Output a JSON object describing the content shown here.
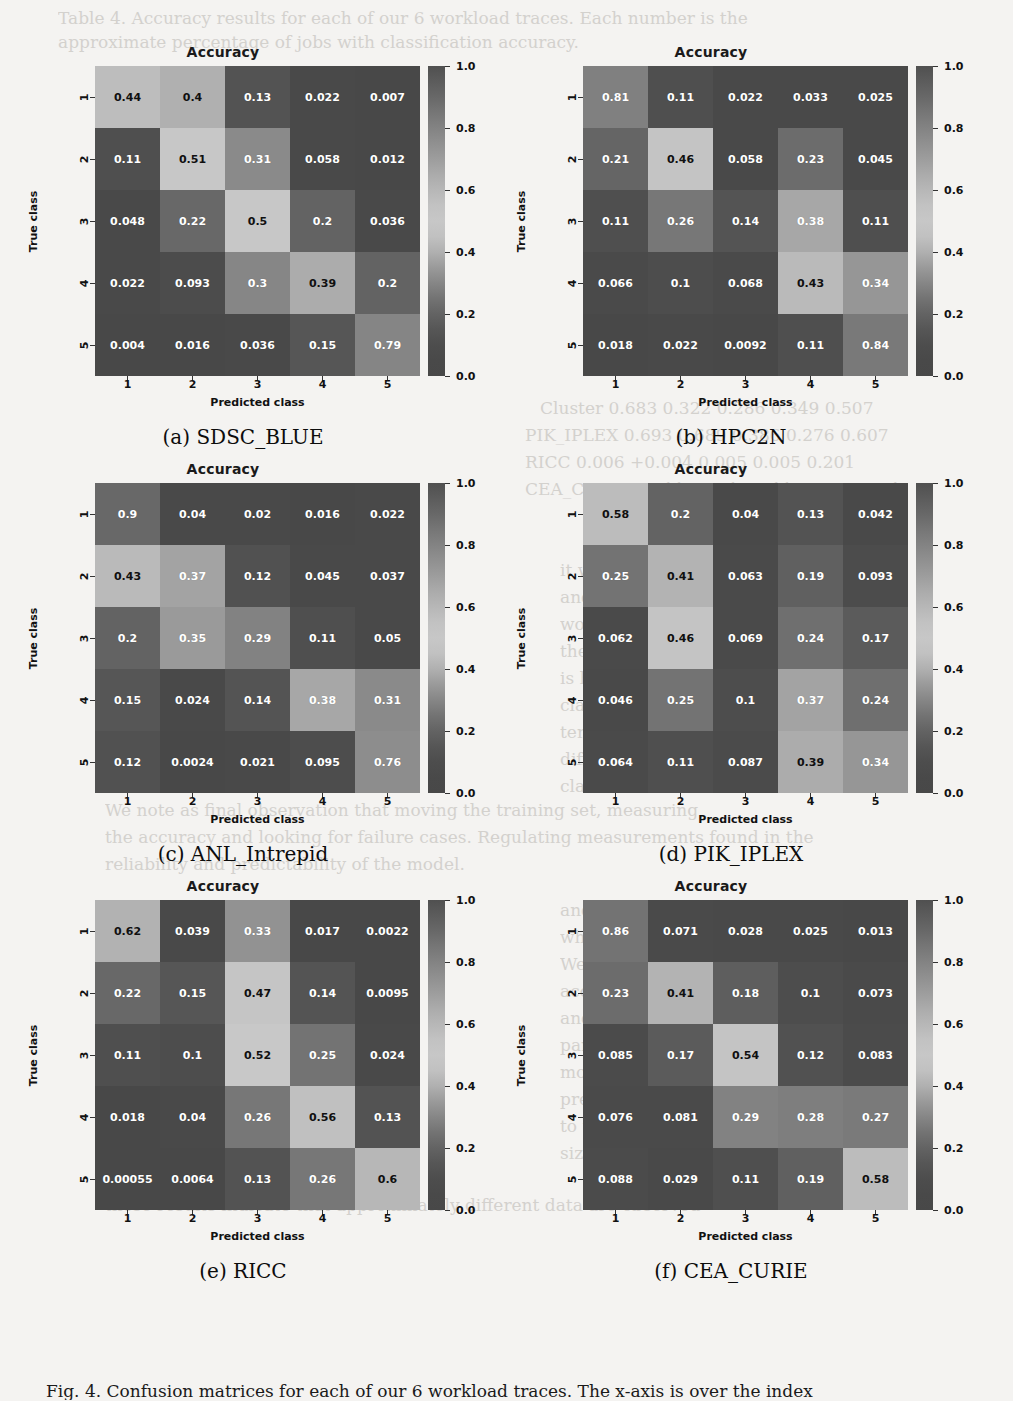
{
  "figure": {
    "caption": "Fig. 4. Confusion matrices for each of our 6 workload traces. The x-axis is over the index",
    "ghost_texts": [
      {
        "text": "Table 4. Accuracy results for each of our 6 workload traces. Each number is the",
        "x": 58,
        "y": 8,
        "size": 17
      },
      {
        "text": "approximate percentage of jobs with classification accuracy.",
        "x": 58,
        "y": 32,
        "size": 17
      },
      {
        "text": "0.226",
        "x": 672,
        "y": 175,
        "size": 17
      },
      {
        "text": "0.342",
        "x": 700,
        "y": 263,
        "size": 17
      },
      {
        "text": "0.588",
        "x": 700,
        "y": 322,
        "size": 17
      },
      {
        "text": "Cluster     0.683    0.322    0.286    0.349    0.507",
        "x": 540,
        "y": 398,
        "size": 17
      },
      {
        "text": "PIK_IPLEX   0.693    0.689    0.386    0.276    0.607",
        "x": 525,
        "y": 425,
        "size": 17
      },
      {
        "text": "RICC        0.006   +0.004    0.005    0.005    0.201",
        "x": 525,
        "y": 452,
        "size": 17
      },
      {
        "text": "CEA_CURIE   0.911    0.901    0.911    0.907    0.921",
        "x": 525,
        "y": 479,
        "size": 17
      },
      {
        "text": "0.903    0.907    0.903",
        "x": 600,
        "y": 506,
        "size": 17
      },
      {
        "text": "it was measured over a",
        "x": 560,
        "y": 560,
        "size": 17
      },
      {
        "text": "and the quality of the",
        "x": 560,
        "y": 587,
        "size": 17
      },
      {
        "text": "work. It is notable that",
        "x": 560,
        "y": 614,
        "size": 17
      },
      {
        "text": "the accuracy of the model",
        "x": 560,
        "y": 641,
        "size": 17
      },
      {
        "text": "is higher for the easier",
        "x": 560,
        "y": 668,
        "size": 17
      },
      {
        "text": "classes, and the model",
        "x": 560,
        "y": 695,
        "size": 17
      },
      {
        "text": "tends to under-predict the",
        "x": 560,
        "y": 722,
        "size": 17
      },
      {
        "text": "difficult intermediate",
        "x": 560,
        "y": 749,
        "size": 17
      },
      {
        "text": "classes in most traces.",
        "x": 560,
        "y": 776,
        "size": 17
      },
      {
        "text": "We note as final observation that moving the training set, measuring",
        "x": 105,
        "y": 800,
        "size": 17
      },
      {
        "text": "the accuracy and looking for failure cases. Regulating measurements found in the",
        "x": 105,
        "y": 827,
        "size": 17
      },
      {
        "text": "reliability and predictability of the model.",
        "x": 105,
        "y": 854,
        "size": 17
      },
      {
        "text": "and the number of jobs",
        "x": 560,
        "y": 900,
        "size": 17
      },
      {
        "text": "which is close to the",
        "x": 560,
        "y": 927,
        "size": 17
      },
      {
        "text": "We can observe that all",
        "x": 560,
        "y": 954,
        "size": 17
      },
      {
        "text": "accuracy of the models",
        "x": 560,
        "y": 981,
        "size": 17
      },
      {
        "text": "and the HPC2N trace in",
        "x": 560,
        "y": 1008,
        "size": 17
      },
      {
        "text": "particular seems to be a",
        "x": 560,
        "y": 1035,
        "size": 17
      },
      {
        "text": "more difficult dataset to",
        "x": 560,
        "y": 1062,
        "size": 17
      },
      {
        "text": "predict, which may be due",
        "x": 560,
        "y": 1089,
        "size": 17
      },
      {
        "text": "to the relatively smaller",
        "x": 560,
        "y": 1116,
        "size": 17
      },
      {
        "text": "size of its training set.",
        "x": 560,
        "y": 1143,
        "size": 17
      },
      {
        "text": "these results indicate that approximately different data are observed",
        "x": 105,
        "y": 1195,
        "size": 17
      }
    ]
  },
  "colorbar": {
    "ticks": [
      "1.0",
      "0.8",
      "0.6",
      "0.4",
      "0.2",
      "0.0"
    ],
    "tick_values": [
      1.0,
      0.8,
      0.6,
      0.4,
      0.2,
      0.0
    ],
    "vmin": 0.0,
    "vmax": 1.0
  },
  "axis": {
    "title": "Accuracy",
    "xlabel": "Predicted class",
    "ylabel": "True class",
    "xticks": [
      "1",
      "2",
      "3",
      "4",
      "5"
    ],
    "yticks": [
      "1",
      "2",
      "3",
      "4",
      "5"
    ]
  },
  "chart_data": [
    {
      "type": "heatmap",
      "panel": "a",
      "caption": "(a) SDSC_BLUE",
      "title": "Accuracy",
      "xlabel": "Predicted class",
      "ylabel": "True class",
      "xticklabels": [
        "1",
        "2",
        "3",
        "4",
        "5"
      ],
      "yticklabels": [
        "1",
        "2",
        "3",
        "4",
        "5"
      ],
      "zlim": [
        0.0,
        1.0
      ],
      "matrix": [
        [
          0.44,
          0.4,
          0.13,
          0.022,
          0.007
        ],
        [
          0.11,
          0.51,
          0.31,
          0.058,
          0.012
        ],
        [
          0.048,
          0.22,
          0.5,
          0.2,
          0.036
        ],
        [
          0.022,
          0.093,
          0.3,
          0.39,
          0.2
        ],
        [
          0.004,
          0.016,
          0.036,
          0.15,
          0.79
        ]
      ],
      "labels": [
        [
          "0.44",
          "0.4",
          "0.13",
          "0.022",
          "0.007"
        ],
        [
          "0.11",
          "0.51",
          "0.31",
          "0.058",
          "0.012"
        ],
        [
          "0.048",
          "0.22",
          "0.5",
          "0.2",
          "0.036"
        ],
        [
          "0.022",
          "0.093",
          "0.3",
          "0.39",
          "0.2"
        ],
        [
          "0.004",
          "0.016",
          "0.036",
          "0.15",
          "0.79"
        ]
      ]
    },
    {
      "type": "heatmap",
      "panel": "b",
      "caption": "(b) HPC2N",
      "title": "Accuracy",
      "xlabel": "Predicted class",
      "ylabel": "True class",
      "xticklabels": [
        "1",
        "2",
        "3",
        "4",
        "5"
      ],
      "yticklabels": [
        "1",
        "2",
        "3",
        "4",
        "5"
      ],
      "zlim": [
        0.0,
        1.0
      ],
      "matrix": [
        [
          0.81,
          0.11,
          0.022,
          0.033,
          0.025
        ],
        [
          0.21,
          0.46,
          0.058,
          0.23,
          0.045
        ],
        [
          0.11,
          0.26,
          0.14,
          0.38,
          0.11
        ],
        [
          0.066,
          0.1,
          0.068,
          0.43,
          0.34
        ],
        [
          0.018,
          0.022,
          0.0092,
          0.11,
          0.84
        ]
      ],
      "labels": [
        [
          "0.81",
          "0.11",
          "0.022",
          "0.033",
          "0.025"
        ],
        [
          "0.21",
          "0.46",
          "0.058",
          "0.23",
          "0.045"
        ],
        [
          "0.11",
          "0.26",
          "0.14",
          "0.38",
          "0.11"
        ],
        [
          "0.066",
          "0.1",
          "0.068",
          "0.43",
          "0.34"
        ],
        [
          "0.018",
          "0.022",
          "0.0092",
          "0.11",
          "0.84"
        ]
      ]
    },
    {
      "type": "heatmap",
      "panel": "c",
      "caption": "(c) ANL_Intrepid",
      "title": "Accuracy",
      "xlabel": "Predicted class",
      "ylabel": "True class",
      "xticklabels": [
        "1",
        "2",
        "3",
        "4",
        "5"
      ],
      "yticklabels": [
        "1",
        "2",
        "3",
        "4",
        "5"
      ],
      "zlim": [
        0.0,
        1.0
      ],
      "matrix": [
        [
          0.9,
          0.04,
          0.02,
          0.016,
          0.022
        ],
        [
          0.43,
          0.37,
          0.12,
          0.045,
          0.037
        ],
        [
          0.2,
          0.35,
          0.29,
          0.11,
          0.05
        ],
        [
          0.15,
          0.024,
          0.14,
          0.38,
          0.31
        ],
        [
          0.12,
          0.0024,
          0.021,
          0.095,
          0.76
        ]
      ],
      "labels": [
        [
          "0.9",
          "0.04",
          "0.02",
          "0.016",
          "0.022"
        ],
        [
          "0.43",
          "0.37",
          "0.12",
          "0.045",
          "0.037"
        ],
        [
          "0.2",
          "0.35",
          "0.29",
          "0.11",
          "0.05"
        ],
        [
          "0.15",
          "0.024",
          "0.14",
          "0.38",
          "0.31"
        ],
        [
          "0.12",
          "0.0024",
          "0.021",
          "0.095",
          "0.76"
        ]
      ]
    },
    {
      "type": "heatmap",
      "panel": "d",
      "caption": "(d) PIK_IPLEX",
      "title": "Accuracy",
      "xlabel": "Predicted class",
      "ylabel": "True class",
      "xticklabels": [
        "1",
        "2",
        "3",
        "4",
        "5"
      ],
      "yticklabels": [
        "1",
        "2",
        "3",
        "4",
        "5"
      ],
      "zlim": [
        0.0,
        1.0
      ],
      "matrix": [
        [
          0.58,
          0.2,
          0.04,
          0.13,
          0.042
        ],
        [
          0.25,
          0.41,
          0.063,
          0.19,
          0.093
        ],
        [
          0.062,
          0.46,
          0.069,
          0.24,
          0.17
        ],
        [
          0.046,
          0.25,
          0.1,
          0.37,
          0.24
        ],
        [
          0.064,
          0.11,
          0.087,
          0.39,
          0.34
        ]
      ],
      "labels": [
        [
          "0.58",
          "0.2",
          "0.04",
          "0.13",
          "0.042"
        ],
        [
          "0.25",
          "0.41",
          "0.063",
          "0.19",
          "0.093"
        ],
        [
          "0.062",
          "0.46",
          "0.069",
          "0.24",
          "0.17"
        ],
        [
          "0.046",
          "0.25",
          "0.1",
          "0.37",
          "0.24"
        ],
        [
          "0.064",
          "0.11",
          "0.087",
          "0.39",
          "0.34"
        ]
      ]
    },
    {
      "type": "heatmap",
      "panel": "e",
      "caption": "(e) RICC",
      "title": "Accuracy",
      "xlabel": "Predicted class",
      "ylabel": "True class",
      "xticklabels": [
        "1",
        "2",
        "3",
        "4",
        "5"
      ],
      "yticklabels": [
        "1",
        "2",
        "3",
        "4",
        "5"
      ],
      "zlim": [
        0.0,
        1.0
      ],
      "matrix": [
        [
          0.62,
          0.039,
          0.33,
          0.017,
          0.0022
        ],
        [
          0.22,
          0.15,
          0.47,
          0.14,
          0.0095
        ],
        [
          0.11,
          0.1,
          0.52,
          0.25,
          0.024
        ],
        [
          0.018,
          0.04,
          0.26,
          0.56,
          0.13
        ],
        [
          0.00055,
          0.0064,
          0.13,
          0.26,
          0.6
        ]
      ],
      "labels": [
        [
          "0.62",
          "0.039",
          "0.33",
          "0.017",
          "0.0022"
        ],
        [
          "0.22",
          "0.15",
          "0.47",
          "0.14",
          "0.0095"
        ],
        [
          "0.11",
          "0.1",
          "0.52",
          "0.25",
          "0.024"
        ],
        [
          "0.018",
          "0.04",
          "0.26",
          "0.56",
          "0.13"
        ],
        [
          "0.00055",
          "0.0064",
          "0.13",
          "0.26",
          "0.6"
        ]
      ]
    },
    {
      "type": "heatmap",
      "panel": "f",
      "caption": "(f) CEA_CURIE",
      "title": "Accuracy",
      "xlabel": "Predicted class",
      "ylabel": "True class",
      "xticklabels": [
        "1",
        "2",
        "3",
        "4",
        "5"
      ],
      "yticklabels": [
        "1",
        "2",
        "3",
        "4",
        "5"
      ],
      "zlim": [
        0.0,
        1.0
      ],
      "matrix": [
        [
          0.86,
          0.071,
          0.028,
          0.025,
          0.013
        ],
        [
          0.23,
          0.41,
          0.18,
          0.1,
          0.073
        ],
        [
          0.085,
          0.17,
          0.54,
          0.12,
          0.083
        ],
        [
          0.076,
          0.081,
          0.29,
          0.28,
          0.27
        ],
        [
          0.088,
          0.029,
          0.11,
          0.19,
          0.58
        ]
      ],
      "labels": [
        [
          "0.86",
          "0.071",
          "0.028",
          "0.025",
          "0.013"
        ],
        [
          "0.23",
          "0.41",
          "0.18",
          "0.1",
          "0.073"
        ],
        [
          "0.085",
          "0.17",
          "0.54",
          "0.12",
          "0.083"
        ],
        [
          "0.076",
          "0.081",
          "0.29",
          "0.28",
          "0.27"
        ],
        [
          "0.088",
          "0.029",
          "0.11",
          "0.19",
          "0.58"
        ]
      ]
    }
  ]
}
